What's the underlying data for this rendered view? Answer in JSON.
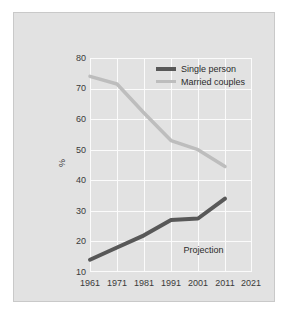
{
  "chart_data": {
    "type": "line",
    "title": "",
    "xlabel": "",
    "ylabel": "%",
    "x": [
      1961,
      1971,
      1981,
      1991,
      2001,
      2011,
      2021
    ],
    "xtick_labels": [
      "1961",
      "1971",
      "1981",
      "1991",
      "2001",
      "2011",
      "2021"
    ],
    "xlim": [
      1961,
      2021
    ],
    "ylim": [
      10,
      80
    ],
    "ytick_labels": [
      "80",
      "70",
      "60",
      "50",
      "40",
      "30",
      "20",
      "10"
    ],
    "yticks": [
      80,
      70,
      60,
      50,
      40,
      30,
      20,
      10
    ],
    "grid": true,
    "legend_position": "top-right",
    "series": [
      {
        "name": "Single person",
        "color": "#585858",
        "line_width": 4,
        "x": [
          1961,
          1971,
          1981,
          1991,
          2001,
          2011
        ],
        "values": [
          14,
          18,
          22,
          27,
          27.5,
          34
        ]
      },
      {
        "name": "Married couples",
        "color": "#bdbdbd",
        "line_width": 3.5,
        "x": [
          1961,
          1971,
          1981,
          1991,
          2001,
          2011
        ],
        "values": [
          74,
          71.5,
          62,
          53,
          50,
          44.5
        ]
      }
    ],
    "annotations": [
      {
        "text": "Projection",
        "x": 2006,
        "y": 17
      }
    ]
  },
  "figure": {
    "background": "#ffffff",
    "panel_color": "#e2e2e2",
    "panel_border": "#c9c9c9",
    "grid_color": "#fbfbfb",
    "text_color": "#3a3a3a"
  }
}
